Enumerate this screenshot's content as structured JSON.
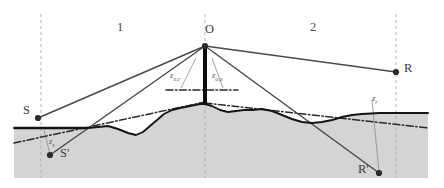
{
  "figure": {
    "type": "geometry-diagram",
    "colors": {
      "ground_fill": "#d4d4d4",
      "ray_line": "#4a4a4a",
      "terrain_line": "#141414",
      "dashdot_line": "#2a2a2a",
      "guide_dashed": "#b0a8a8",
      "thin_leader": "#8a8a8a",
      "apex_bar": "#0d0d0d",
      "text": "#3a3a3a",
      "background": "#ffffff"
    },
    "region_labels": [
      {
        "name": "region-1",
        "text": "1",
        "x": 117,
        "y": 21
      },
      {
        "name": "region-2",
        "text": "2",
        "x": 310,
        "y": 21
      }
    ],
    "point_labels": [
      {
        "name": "point-O",
        "text": "O",
        "x": 205,
        "y": 23
      },
      {
        "name": "point-S",
        "text": "S",
        "x": 23,
        "y": 104
      },
      {
        "name": "point-S-prime",
        "text": "S'",
        "x": 60,
        "y": 147
      },
      {
        "name": "point-R",
        "text": "R",
        "x": 404,
        "y": 62
      },
      {
        "name": "point-R-prime",
        "text": "R'",
        "x": 358,
        "y": 163
      }
    ],
    "distance_labels": [
      {
        "name": "z-o-r",
        "base": "z",
        "sub": "o,r",
        "x": 170,
        "y": 71
      },
      {
        "name": "z-o-s",
        "base": "z",
        "sub": "o,s",
        "x": 212,
        "y": 71
      },
      {
        "name": "z-s",
        "base": "z",
        "sub": "s",
        "x": 49,
        "y": 137
      },
      {
        "name": "z-r",
        "base": "z",
        "sub": "r",
        "x": 372,
        "y": 94
      }
    ],
    "markers": [
      {
        "name": "marker-O",
        "x": 205,
        "y": 46
      },
      {
        "name": "marker-S",
        "x": 38,
        "y": 118
      },
      {
        "name": "marker-S-prime",
        "x": 50,
        "y": 155
      },
      {
        "name": "marker-R",
        "x": 396,
        "y": 72
      },
      {
        "name": "marker-R-prime",
        "x": 379,
        "y": 173
      }
    ],
    "vertical_guides": [
      {
        "name": "guide-S",
        "x": 41,
        "y1": 14,
        "y2": 178
      },
      {
        "name": "guide-O",
        "x": 205,
        "y1": 14,
        "y2": 178
      },
      {
        "name": "guide-R",
        "x": 396,
        "y1": 14,
        "y2": 178
      }
    ],
    "ground_fill_path": "M 14,128 L 88,128 L 98,127 L 108,126 L 118,129 L 128,133 L 136,135 L 143,132 L 150,126 L 157,120 L 164,114 L 172,110 L 180,108 L 190,106 L 200,104 L 205,104 L 212,106 L 220,110 L 228,112 L 236,111 L 244,110 L 252,110 L 262,109 L 272,111 L 282,115 L 292,119 L 302,122 L 312,123 L 322,122 L 332,120 L 342,117 L 352,115 L 362,114 L 380,113 L 400,113 L 428,113 L 428,178 L 14,178 Z",
    "terrain_path": "M 14,128 L 88,128 L 98,127 L 108,126 L 118,129 L 128,133 L 136,135 L 143,132 L 150,126 L 157,120 L 164,114 L 172,110 L 180,108 L 190,106 L 200,104 L 205,104 L 212,106 L 220,110 L 228,112 L 236,111 L 244,110 L 252,110 L 262,109 L 272,111 L 282,115 L 292,119 L 302,122 L 312,123 L 322,122 L 332,120 L 342,117 L 352,115 L 362,114 L 380,113 L 400,113 L 428,113",
    "sea_level_left": {
      "name": "sea-level-left",
      "x1": 14,
      "y1": 128,
      "x2": 88,
      "y2": 128
    },
    "dashdot_left": {
      "name": "dashdot-left-slope",
      "x1": 14,
      "y1": 143,
      "x2": 205,
      "y2": 102
    },
    "dashdot_right": {
      "name": "dashdot-right-slope",
      "x1": 205,
      "y1": 103,
      "x2": 428,
      "y2": 128
    },
    "dashdot_apex_short": {
      "name": "dashdot-apex-tangent",
      "x1": 166,
      "y1": 90,
      "x2": 238,
      "y2": 90
    },
    "rays": [
      {
        "name": "ray-O-to-S",
        "x1": 205,
        "y1": 46,
        "x2": 38,
        "y2": 118
      },
      {
        "name": "ray-O-to-S-prime",
        "x1": 205,
        "y1": 46,
        "x2": 50,
        "y2": 155
      },
      {
        "name": "ray-O-to-R",
        "x1": 205,
        "y1": 46,
        "x2": 396,
        "y2": 72
      },
      {
        "name": "ray-O-to-R-prime",
        "x1": 205,
        "y1": 46,
        "x2": 379,
        "y2": 173
      }
    ],
    "leaders": [
      {
        "name": "leader-z-o-r",
        "x1": 196,
        "y1": 58,
        "x2": 181,
        "y2": 88
      },
      {
        "name": "leader-z-o-s",
        "x1": 212,
        "y1": 58,
        "x2": 223,
        "y2": 88
      },
      {
        "name": "leader-z-s",
        "x1": 44,
        "y1": 130,
        "x2": 50,
        "y2": 154
      },
      {
        "name": "leader-z-r",
        "x1": 372,
        "y1": 100,
        "x2": 379,
        "y2": 172
      }
    ],
    "apex_bar": {
      "name": "apex-vertical-bar",
      "x": 205,
      "y_top": 46,
      "y_bottom": 104,
      "width": 4
    }
  }
}
